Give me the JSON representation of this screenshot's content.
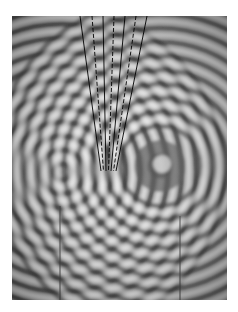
{
  "figure": {
    "sources": [
      {
        "name": "left-source",
        "cx": 50,
        "cy": 156
      },
      {
        "name": "right-source",
        "cx": 148,
        "cy": 150
      }
    ],
    "overlay_lines": {
      "solid_top_x": [
        68,
        91,
        113,
        135
      ],
      "dashed_top_x": [
        80,
        102,
        124
      ],
      "converge_y": 155,
      "converge_x_range": [
        89,
        104
      ]
    },
    "colors": {
      "background": "#ffffff",
      "wave_light": "#e6e6e6",
      "wave_dark": "#3a3a3a",
      "line": "#000000"
    }
  }
}
